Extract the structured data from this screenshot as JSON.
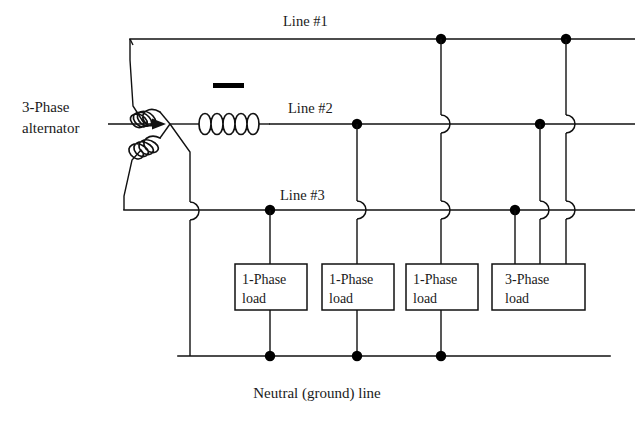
{
  "figure": {
    "kind": "electrical-schematic",
    "background_color": "#ffffff",
    "ink_color": "#111111"
  },
  "labels": {
    "source_line1": "3-Phase",
    "source_line2": "alternator",
    "line1": "Line #1",
    "line2": "Line #2",
    "line3": "Line #3",
    "neutral_caption": "Neutral (ground) line"
  },
  "loads": [
    {
      "id": "load-1",
      "line1": "1-Phase",
      "line2": "load",
      "type": "1-phase",
      "fed_from": "Line #3",
      "returns_to": "Neutral"
    },
    {
      "id": "load-2",
      "line1": "1-Phase",
      "line2": "load",
      "type": "1-phase",
      "fed_from": "Line #2",
      "returns_to": "Neutral"
    },
    {
      "id": "load-3",
      "line1": "1-Phase",
      "line2": "load",
      "type": "1-phase",
      "fed_from": "Line #1",
      "returns_to": "Neutral"
    },
    {
      "id": "load-4",
      "line1": "3-Phase",
      "line2": "load",
      "type": "3-phase",
      "fed_from": "Line #1, Line #2, Line #3",
      "returns_to": "none"
    }
  ],
  "conductors": [
    {
      "name": "Line #1",
      "y": 39
    },
    {
      "name": "Line #2",
      "y": 124
    },
    {
      "name": "Line #3",
      "y": 210
    },
    {
      "name": "Neutral (ground) line",
      "y": 356
    }
  ],
  "annotations": {
    "phase_marker": "bar-marker-above-center-coil",
    "source_arrow": "arrow-pointing-to-alternator"
  }
}
